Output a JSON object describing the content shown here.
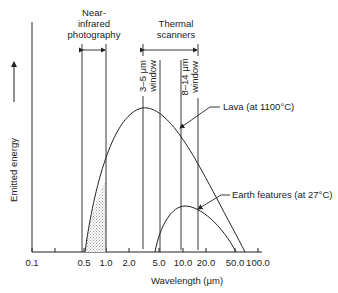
{
  "diagram": {
    "y_axis_label": "Emitted energy",
    "x_axis_label": "Wavelength (μm)",
    "x_ticks": [
      {
        "label": "0.1",
        "x": 32
      },
      {
        "label": "",
        "x": 55
      },
      {
        "label": "0.5",
        "x": 84
      },
      {
        "label": "1.0",
        "x": 106
      },
      {
        "label": "2.0",
        "x": 129
      },
      {
        "label": "5.0",
        "x": 159
      },
      {
        "label": "10.0",
        "x": 183
      },
      {
        "label": "20.0",
        "x": 206
      },
      {
        "label": "50.0",
        "x": 235
      },
      {
        "label": "100.0",
        "x": 258
      }
    ],
    "bands": {
      "near_ir": {
        "line1": "Near-",
        "line2": "infrared",
        "line3": "photography"
      },
      "thermal": {
        "line1": "Thermal",
        "line2": "scanners"
      }
    },
    "windows": {
      "w35": {
        "line1": "3–5 μm",
        "line2": "window"
      },
      "w814": {
        "line1": "8–14 μm",
        "line2": "window"
      }
    },
    "curves": {
      "lava": "Lava (at 1100°C)",
      "earth": "Earth features (at 27°C)"
    },
    "colors": {
      "ink": "#222222",
      "hatch": "#bbbbbb",
      "background": "#ffffff"
    }
  }
}
